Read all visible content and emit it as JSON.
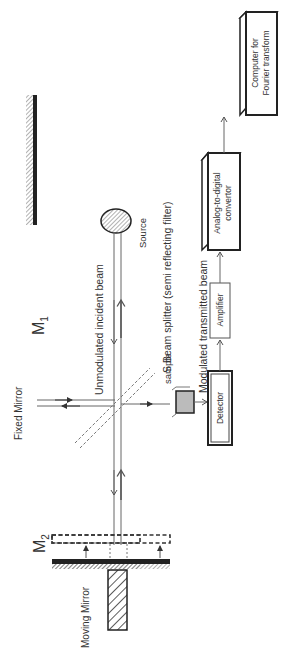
{
  "diagram": {
    "orientation": "rotated 90 degrees counter-clockwise",
    "labels": {
      "m1": "M",
      "m1_sub": "1",
      "m2": "M",
      "m2_sub": "2",
      "fixed_mirror": "Fixed Mirror",
      "moving_mirror": "Moving Mirror",
      "unmodulated_beam": "Unmodulated incident beam",
      "source": "Source",
      "beam_splitter": "S    Beam splitter (semi reflecting filter)",
      "sample": "sample",
      "modulated_beam": "Modulated transmitted beam"
    },
    "blocks": [
      {
        "id": "detector",
        "label": "Detector"
      },
      {
        "id": "amplifier",
        "label": "Amplifier"
      },
      {
        "id": "adc",
        "label_line1": "Analog-to-digital",
        "label_line2": "convertor"
      },
      {
        "id": "computer",
        "label_line1": "Computer for",
        "label_line2": "Fourier transform"
      }
    ],
    "colors": {
      "line": "#555555",
      "dark": "#222222",
      "hatch": "#777777",
      "sample_fill": "#bbbbbb"
    }
  }
}
